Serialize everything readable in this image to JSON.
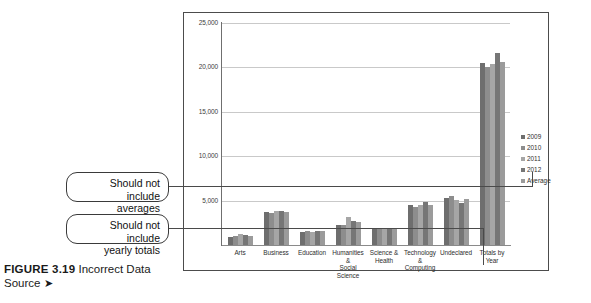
{
  "caption": {
    "figure_number": "FIGURE 3.19",
    "title": "Incorrect Data Source",
    "arrow": "➤"
  },
  "callouts": [
    {
      "id": "averages",
      "line1": "Should not include",
      "line2": "averages"
    },
    {
      "id": "totals",
      "line1": "Should not include",
      "line2": "yearly totals"
    }
  ],
  "chart_data": {
    "type": "bar",
    "title": "",
    "xlabel": "",
    "ylabel": "",
    "ylim": [
      0,
      25000
    ],
    "grid": true,
    "legend_position": "right",
    "yticks": [
      "5,000",
      "10,000",
      "15,000",
      "20,000",
      "25,000"
    ],
    "ytick_values": [
      5000,
      10000,
      15000,
      20000,
      25000
    ],
    "categories": [
      "Arts",
      "Business",
      "Education",
      "Humanities & Social Science",
      "Science & Health",
      "Technology & Computing",
      "Undeclared",
      "Totals by Year"
    ],
    "category_lines": [
      [
        "Arts",
        ""
      ],
      [
        "Business",
        ""
      ],
      [
        "Education",
        ""
      ],
      [
        "Humanities &",
        "Social Science"
      ],
      [
        "Science &",
        "Health"
      ],
      [
        "Technology &",
        "Computing"
      ],
      [
        "Undeclared",
        ""
      ],
      [
        "Totals by Year",
        ""
      ]
    ],
    "series": [
      {
        "name": "2009",
        "color": "#6e6e6e",
        "values": [
          900,
          3750,
          1500,
          2250,
          1900,
          4450,
          5250,
          20450
        ]
      },
      {
        "name": "2010",
        "color": "#8d8d8d",
        "values": [
          1050,
          3550,
          1600,
          2300,
          1750,
          4300,
          5550,
          20050
        ]
      },
      {
        "name": "2011",
        "color": "#a6a6a6",
        "values": [
          1200,
          3800,
          1500,
          3150,
          1800,
          4450,
          5100,
          20400
        ]
      },
      {
        "name": "2012",
        "color": "#767676",
        "values": [
          1100,
          3850,
          1550,
          2700,
          1900,
          4800,
          4750,
          21650
        ]
      },
      {
        "name": "Average",
        "color": "#9b9b9b",
        "values": [
          1050,
          3750,
          1550,
          2600,
          1850,
          4500,
          5150,
          20650
        ]
      }
    ]
  }
}
